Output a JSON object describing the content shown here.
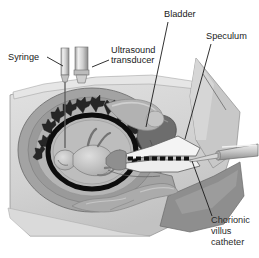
{
  "figure": {
    "type": "medical-anatomical-illustration",
    "width": 259,
    "height": 258,
    "background_color": "#ffffff"
  },
  "labels": [
    {
      "id": "syringe",
      "text": "Syringe",
      "x": 8,
      "y": 60,
      "anchor": "start",
      "leader": "M 47 57 L 63 66"
    },
    {
      "id": "ultrasound_transducer",
      "text_line1": "Ultrasound",
      "text_line2": "transducer",
      "x": 111,
      "y": 53,
      "x2": 111,
      "y2": 63,
      "anchor": "start",
      "leader": "M 109 60 L 92 67"
    },
    {
      "id": "bladder",
      "text": "Bladder",
      "x": 164,
      "y": 17,
      "anchor": "start",
      "leader": "M 168 22 L 146 127"
    },
    {
      "id": "speculum",
      "text": "Speculum",
      "x": 206,
      "y": 39,
      "anchor": "start",
      "leader": "M 211 44 L 185 139"
    },
    {
      "id": "chorionic_villus_catheter",
      "text_line1": "Chorionic",
      "text_line2": "villus",
      "text_line3": "catheter",
      "x": 211,
      "y": 223,
      "x2": 211,
      "y2": 234,
      "x3": 211,
      "y3": 245,
      "anchor": "start",
      "leader": "M 212 216 L 192 161"
    }
  ],
  "anatomy": [
    {
      "id": "maternal-body-cross-section",
      "name": "Maternal body cross section",
      "color": "#d2d2d2"
    },
    {
      "id": "thigh-leg",
      "name": "Thigh / leg",
      "color": "#c6c6c6"
    },
    {
      "id": "buttock",
      "name": "Buttock",
      "color": "#8e8e8e"
    },
    {
      "id": "uterus-wall",
      "name": "Uterine wall",
      "color": "#9d9d9d"
    },
    {
      "id": "chorionic-villi",
      "name": "Chorionic villi",
      "color": "#2e2e2e"
    },
    {
      "id": "amniotic-sac",
      "name": "Amniotic sac membrane",
      "color": "#0d0d0d"
    },
    {
      "id": "amniotic-fluid",
      "name": "Amniotic fluid",
      "color": "#b8b8b8"
    },
    {
      "id": "fetus",
      "name": "Fetus",
      "color": "#c9c9c9"
    },
    {
      "id": "bladder-organ",
      "name": "Bladder",
      "color": "#6d6d6d"
    },
    {
      "id": "colon-bowel",
      "name": "Colon / bowel",
      "color": "#a8a8a8"
    },
    {
      "id": "cervix",
      "name": "Cervix",
      "color": "#8a8a8a"
    },
    {
      "id": "vaginal-canal",
      "name": "Vaginal canal",
      "color": "#b0b0b0"
    }
  ],
  "instruments": [
    {
      "id": "syringe-barrel",
      "name": "Syringe barrel",
      "color": "#d8d8d8"
    },
    {
      "id": "syringe-needle",
      "name": "Syringe needle",
      "color": "#6a6a6a"
    },
    {
      "id": "transducer-body",
      "name": "Ultrasound transducer body",
      "color": "#d0d0d0"
    },
    {
      "id": "speculum-blade",
      "name": "Speculum blade",
      "color": "#f2f2f2"
    },
    {
      "id": "catheter-tube",
      "name": "Chorionic villus catheter",
      "color": "#c4c4c4"
    }
  ],
  "colors": {
    "ink": "#1a1a1a",
    "skin_light": "#dcdcdc",
    "skin_mid": "#c6c6c6",
    "tissue_mid": "#a4a4a4",
    "tissue_dark": "#6d6d6d",
    "darkest": "#0d0d0d",
    "white": "#ffffff"
  }
}
